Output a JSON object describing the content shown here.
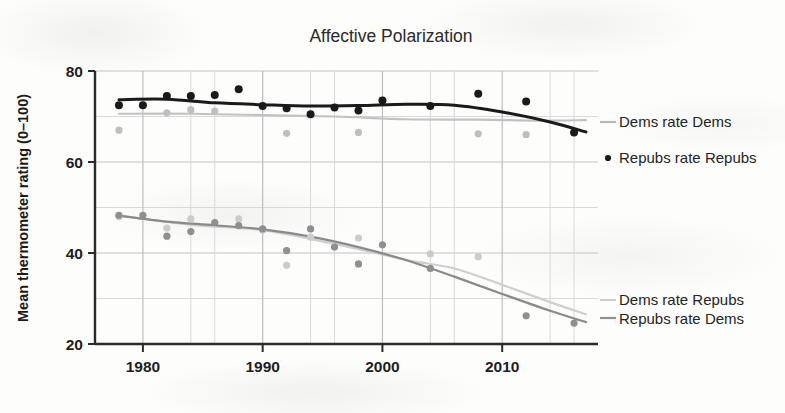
{
  "figure": {
    "background_color": "#fdfdfc",
    "kind": "scanned-book-figure"
  },
  "chart_data": {
    "type": "scatter",
    "title": "Affective Polarization",
    "xlabel": "",
    "ylabel": "Mean thermometer rating (0–100)",
    "xlim": [
      1976,
      2018
    ],
    "ylim": [
      20,
      80
    ],
    "xticks": [
      1980,
      1990,
      2000,
      2010
    ],
    "xtick_labels": [
      "1980",
      "1990",
      "2000",
      "2010"
    ],
    "yticks": [
      20,
      40,
      60,
      80
    ],
    "ytick_labels": [
      "20",
      "40",
      "60",
      "80"
    ],
    "y_minor_gridlines": [
      30,
      50,
      70
    ],
    "x_minor_gridlines": [
      1984,
      1986,
      1994,
      1996,
      2004,
      2006,
      2014,
      2016
    ],
    "grid": true,
    "legend_position": "right-inline",
    "series": [
      {
        "name": "Repubs rate Repubs",
        "color": "#1a1a1a",
        "marker": "circle",
        "has_trend_line": true,
        "trend_color": "#1a1a1a",
        "x": [
          1978,
          1980,
          1982,
          1984,
          1986,
          1988,
          1990,
          1992,
          1994,
          1996,
          1998,
          2000,
          2004,
          2008,
          2012,
          2016
        ],
        "y": [
          72.5,
          72.5,
          74.5,
          74.5,
          74.7,
          76.0,
          72.3,
          71.8,
          70.5,
          72.0,
          71.3,
          73.5,
          72.3,
          75.0,
          73.3,
          66.5
        ],
        "trend_x": [
          1978,
          1982,
          1986,
          1990,
          1994,
          1998,
          2002,
          2006,
          2010,
          2014,
          2017
        ],
        "trend_y": [
          73.7,
          73.8,
          73.0,
          72.6,
          72.3,
          72.4,
          72.7,
          72.5,
          71.0,
          68.8,
          66.6
        ]
      },
      {
        "name": "Dems rate Dems",
        "color": "#bfbfbf",
        "marker": "circle",
        "has_trend_line": true,
        "trend_color": "#c2c2c2",
        "x": [
          1978,
          1982,
          1984,
          1986,
          1992,
          1998,
          2008,
          2012
        ],
        "y": [
          67.0,
          70.8,
          71.5,
          71.2,
          66.3,
          66.5,
          66.2,
          66.0
        ],
        "trend_x": [
          1978,
          1984,
          1990,
          1996,
          2002,
          2008,
          2013,
          2017
        ],
        "trend_y": [
          70.6,
          70.6,
          70.3,
          70.0,
          69.4,
          69.3,
          69.1,
          69.2
        ]
      },
      {
        "name": "Repubs rate Dems",
        "color": "#8f8f8f",
        "marker": "circle",
        "has_trend_line": true,
        "trend_color": "#8a8a8a",
        "x": [
          1978,
          1980,
          1982,
          1984,
          1986,
          1988,
          1990,
          1992,
          1994,
          1996,
          1998,
          2000,
          2004,
          2012,
          2016
        ],
        "y": [
          48.3,
          48.3,
          43.7,
          44.7,
          46.7,
          46.0,
          45.3,
          40.5,
          45.3,
          41.3,
          37.6,
          41.8,
          36.6,
          26.2,
          24.6
        ],
        "trend_x": [
          1978,
          1982,
          1986,
          1990,
          1994,
          1998,
          2002,
          2006,
          2010,
          2014,
          2017
        ],
        "trend_y": [
          48.2,
          46.9,
          46.1,
          45.2,
          43.6,
          41.3,
          38.4,
          34.8,
          31.0,
          27.3,
          24.8
        ]
      },
      {
        "name": "Dems rate Repubs",
        "color": "#cccccc",
        "marker": "circle",
        "has_trend_line": true,
        "trend_color": "#cfcfcf",
        "x": [
          1978,
          1982,
          1984,
          1988,
          1990,
          1992,
          1994,
          1998,
          2004,
          2008
        ],
        "y": [
          48.0,
          45.5,
          47.5,
          47.5,
          45.0,
          37.3,
          43.5,
          43.3,
          39.8,
          39.2
        ],
        "trend_x": [
          1978,
          1984,
          1990,
          1996,
          2002,
          2006,
          2010,
          2014,
          2017
        ],
        "trend_y": [
          48.2,
          46.2,
          45.0,
          42.0,
          38.5,
          36.6,
          33.0,
          29.2,
          26.5
        ]
      }
    ],
    "legend_entries": [
      {
        "label": "Dems rate Dems",
        "color": "#bfbfbf",
        "marker": "line"
      },
      {
        "label": "Repubs rate Repubs",
        "color": "#1a1a1a",
        "marker": "dot"
      },
      {
        "label": "Dems rate Repubs",
        "color": "#cccccc",
        "marker": "line"
      },
      {
        "label": "Repubs rate Dems",
        "color": "#8f8f8f",
        "marker": "line"
      }
    ]
  }
}
